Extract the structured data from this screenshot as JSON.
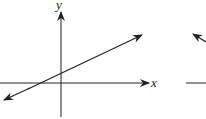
{
  "diagram": {
    "type": "coordinate-plane-line",
    "axes": {
      "x_label": "x",
      "y_label": "y"
    },
    "line": {
      "description": "line with positive slope crossing the y-axis above origin and x-axis left of origin, arrows at both ends"
    },
    "partial_second_graph": {
      "description": "cropped second graph with arrowhead pointing up-left and horizontal axis"
    }
  },
  "colors": {
    "stroke": "#222222",
    "background": "#ffffff"
  }
}
